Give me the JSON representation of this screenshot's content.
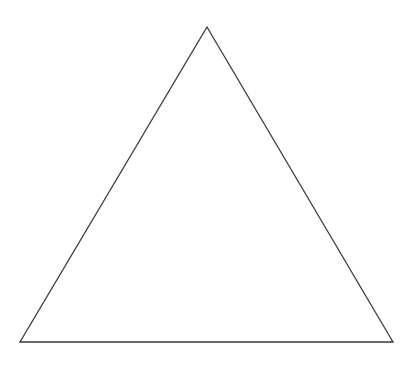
{
  "canvas": {
    "width": 417,
    "height": 376,
    "background_color": "#ffffff"
  },
  "figure": {
    "name": "triangle",
    "shape_type": "triangle",
    "fill": "none",
    "stroke_color": "#3a3a3a",
    "stroke_width": 1.3,
    "points": "207,27 393,342 20,342",
    "vertices": [
      {
        "label": "apex",
        "x": 207,
        "y": 27
      },
      {
        "label": "bottom-right",
        "x": 393,
        "y": 342
      },
      {
        "label": "bottom-left",
        "x": 20,
        "y": 342
      }
    ],
    "edges": [
      {
        "label": "left-edge",
        "from": "bottom-left",
        "to": "apex"
      },
      {
        "label": "right-edge",
        "from": "apex",
        "to": "bottom-right"
      },
      {
        "label": "base-edge",
        "from": "bottom-right",
        "to": "bottom-left"
      }
    ]
  }
}
